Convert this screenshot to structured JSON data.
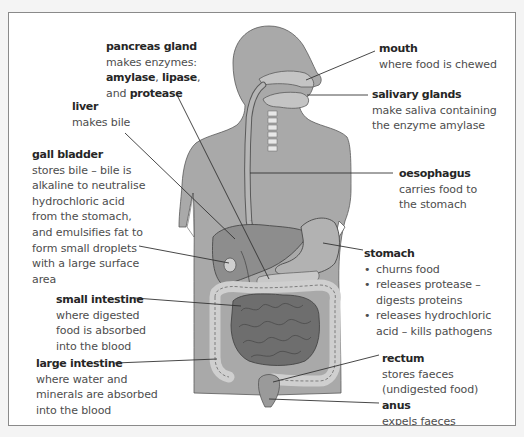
{
  "diagram": {
    "colors": {
      "background": "#f4f4f4",
      "panel": "#ffffff",
      "border": "#8a8a8a",
      "body": "#a9a9a9",
      "organ_light": "#bdbdbd",
      "organ_mid": "#8d8d8d",
      "organ_dark": "#6e6e6e",
      "outline": "#4a4a4a",
      "leader_line": "#333333",
      "heading_text": "#262626",
      "body_text": "#4d4d4d"
    },
    "labels": {
      "pancreas": {
        "title": "pancreas gland",
        "line1": "makes enzymes:",
        "enzyme1": "amylase",
        "sep1": ", ",
        "enzyme2": "lipase",
        "sep2": ",",
        "and": "and ",
        "enzyme3": "protease"
      },
      "liver": {
        "title": "liver",
        "line1": "makes bile"
      },
      "gall_bladder": {
        "title": "gall bladder",
        "lines": [
          "stores bile – bile is",
          "alkaline to neutralise",
          "hydrochloric acid",
          "from the stomach,",
          "and emulsifies fat to",
          "form small droplets",
          "with a large surface",
          "area"
        ]
      },
      "small_intestine": {
        "title": "small intestine",
        "lines": [
          "where digested",
          "food is absorbed",
          "into the blood"
        ]
      },
      "large_intestine": {
        "title": "large intestine",
        "lines": [
          "where water and",
          "minerals are absorbed",
          "into the blood"
        ]
      },
      "mouth": {
        "title": "mouth",
        "line1": "where food is chewed"
      },
      "salivary_glands": {
        "title": "salivary glands",
        "lines": [
          "make saliva containing",
          "the enzyme amylase"
        ]
      },
      "oesophagus": {
        "title": "oesophagus",
        "lines": [
          "carries food to",
          "the stomach"
        ]
      },
      "stomach": {
        "title": "stomach",
        "bullet_glyph": "•",
        "bullets": [
          {
            "text": "churns food",
            "cont": ""
          },
          {
            "text": "releases protease –",
            "cont": "digests proteins"
          },
          {
            "text": "releases hydrochloric",
            "cont": "acid – kills pathogens"
          }
        ]
      },
      "rectum": {
        "title": "rectum",
        "lines": [
          "stores faeces",
          "(undigested food)"
        ]
      },
      "anus": {
        "title": "anus",
        "line1": "expels faeces"
      }
    }
  }
}
